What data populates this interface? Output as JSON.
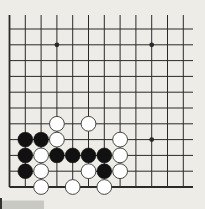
{
  "board": {
    "title": "Go board corner diagram",
    "visible_columns": 12,
    "visible_rows": 11,
    "edges": [
      "left",
      "bottom"
    ],
    "colors": {
      "background": "#edece7",
      "line": "#2a2a2a",
      "black_stone": "#111111",
      "white_stone": "#ffffff",
      "white_outline": "#333333"
    },
    "star_points": [
      {
        "col": 4,
        "row": 10
      },
      {
        "col": 10,
        "row": 10
      },
      {
        "col": 10,
        "row": 4
      }
    ],
    "stones": [
      {
        "color": "white",
        "col": 4,
        "row": 5
      },
      {
        "color": "white",
        "col": 6,
        "row": 5
      },
      {
        "color": "black",
        "col": 2,
        "row": 4
      },
      {
        "color": "black",
        "col": 3,
        "row": 4
      },
      {
        "color": "white",
        "col": 4,
        "row": 4
      },
      {
        "color": "white",
        "col": 8,
        "row": 4
      },
      {
        "color": "black",
        "col": 2,
        "row": 3
      },
      {
        "color": "white",
        "col": 3,
        "row": 3
      },
      {
        "color": "black",
        "col": 4,
        "row": 3
      },
      {
        "color": "black",
        "col": 5,
        "row": 3
      },
      {
        "color": "black",
        "col": 6,
        "row": 3
      },
      {
        "color": "black",
        "col": 7,
        "row": 3
      },
      {
        "color": "white",
        "col": 8,
        "row": 3
      },
      {
        "color": "black",
        "col": 2,
        "row": 2
      },
      {
        "color": "white",
        "col": 3,
        "row": 2
      },
      {
        "color": "white",
        "col": 6,
        "row": 2
      },
      {
        "color": "black",
        "col": 7,
        "row": 2
      },
      {
        "color": "white",
        "col": 8,
        "row": 2
      },
      {
        "color": "white",
        "col": 3,
        "row": 1
      },
      {
        "color": "white",
        "col": 5,
        "row": 1
      },
      {
        "color": "white",
        "col": 7,
        "row": 1
      }
    ]
  }
}
